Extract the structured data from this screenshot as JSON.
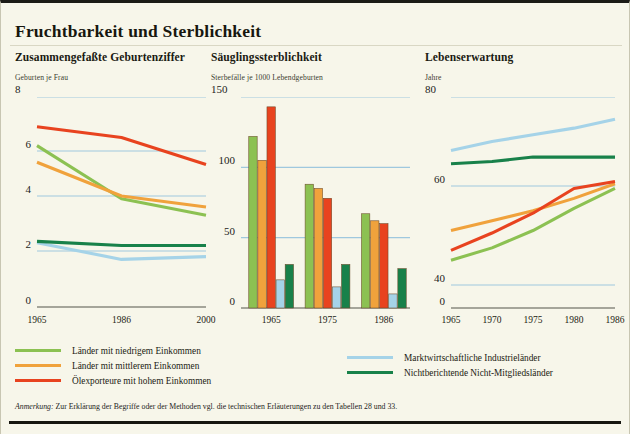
{
  "page": {
    "title": "Fruchtbarkeit und Sterblichkeit",
    "note_label": "Anmerkung:",
    "note_text": " Zur Erklärung der Begriffe oder der Methoden vgl. die technischen Erläuterungen zu den Tabellen 28 und 33.",
    "paper_color": "#f7f6ea",
    "gridline_color": "#9fc8de",
    "axis_color": "#55554a"
  },
  "series_colors": {
    "low_income": "#8cc152",
    "middle_income": "#f0a23c",
    "oil_high_income": "#e8431f",
    "market_industrial": "#a5d3e8",
    "non_reporting": "#18814a"
  },
  "legend": {
    "left": [
      {
        "label": "Länder mit niedrigem Einkommen",
        "color": "#8cc152",
        "key": "low_income"
      },
      {
        "label": "Länder mit mittlerem Einkommen",
        "color": "#f0a23c",
        "key": "middle_income"
      },
      {
        "label": "Ölexporteure mit hohem Einkommen",
        "color": "#e8431f",
        "key": "oil_high_income"
      }
    ],
    "right": [
      {
        "label": "Marktwirtschaftliche Industrieländer",
        "color": "#a5d3e8",
        "key": "market_industrial"
      },
      {
        "label": "Nichtberichtende Nicht-Mitgliedsländer",
        "color": "#18814a",
        "key": "non_reporting"
      }
    ]
  },
  "chart_data": [
    {
      "type": "line",
      "id": "fertility",
      "title": "Zusammengefaßte Geburtenziffer",
      "ylabel": "Geburten je Frau",
      "xlabel": "",
      "x": [
        "1965",
        "1986",
        "2000"
      ],
      "ylim": [
        0,
        8
      ],
      "yticks": [
        0,
        2,
        4,
        6,
        8
      ],
      "ytick_labels": [
        "0",
        "2",
        "4",
        "6",
        "8"
      ],
      "grid": true,
      "axis_max_label": "8",
      "series": [
        {
          "name": "Länder mit niedrigem Einkommen",
          "color": "#8cc152",
          "values": [
            6.2,
            3.9,
            3.3
          ]
        },
        {
          "name": "Länder mit mittlerem Einkommen",
          "color": "#f0a23c",
          "values": [
            5.5,
            4.0,
            3.6
          ]
        },
        {
          "name": "Ölexporteure mit hohem Einkommen",
          "color": "#e8431f",
          "values": [
            6.9,
            6.5,
            5.4
          ]
        },
        {
          "name": "Marktwirtschaftliche Industrieländer",
          "color": "#a5d3e8",
          "values": [
            2.3,
            1.7,
            1.8
          ]
        },
        {
          "name": "Nichtberichtende Nicht-Mitgliedsländer",
          "color": "#18814a",
          "values": [
            2.35,
            2.2,
            2.2
          ]
        }
      ]
    },
    {
      "type": "bar",
      "id": "infant-mortality",
      "title": "Säuglingssterblichkeit",
      "ylabel": "Sterbefälle je 1000 Lebendgeburten",
      "xlabel": "",
      "categories": [
        "1965",
        "1975",
        "1986"
      ],
      "ylim": [
        0,
        150
      ],
      "yticks": [
        0,
        50,
        100,
        150
      ],
      "ytick_labels": [
        "0",
        "50",
        "100",
        "150"
      ],
      "grid": true,
      "axis_max_label": "150",
      "series": [
        {
          "name": "Länder mit niedrigem Einkommen",
          "color": "#8cc152",
          "values": [
            122,
            88,
            67
          ]
        },
        {
          "name": "Länder mit mittlerem Einkommen",
          "color": "#f0a23c",
          "values": [
            105,
            85,
            62
          ]
        },
        {
          "name": "Ölexporteure mit hohem Einkommen",
          "color": "#e8431f",
          "values": [
            143,
            78,
            60
          ]
        },
        {
          "name": "Marktwirtschaftliche Industrieländer",
          "color": "#a5d3e8",
          "values": [
            20,
            15,
            10
          ]
        },
        {
          "name": "Nichtberichtende Nicht-Mitgliedsländer",
          "color": "#18814a",
          "values": [
            31,
            31,
            28
          ]
        }
      ]
    },
    {
      "type": "line",
      "id": "life-expectancy",
      "title": "Lebenserwartung",
      "ylabel": "Jahre",
      "xlabel": "",
      "x": [
        "1965",
        "1970",
        "1975",
        "1980",
        "1986"
      ],
      "ylim": [
        0,
        80
      ],
      "yticks": [
        0,
        40,
        60,
        80
      ],
      "ytick_labels": [
        "0",
        "40",
        "60",
        "80"
      ],
      "grid": true,
      "axis_max_label": "80",
      "series": [
        {
          "name": "Länder mit niedrigem Einkommen",
          "color": "#8cc152",
          "values": [
            45,
            47.5,
            51,
            55.5,
            59.5
          ]
        },
        {
          "name": "Länder mit mittlerem Einkommen",
          "color": "#f0a23c",
          "values": [
            51,
            53,
            55,
            57.5,
            60.5
          ]
        },
        {
          "name": "Ölexporteure mit hohem Einkommen",
          "color": "#e8431f",
          "values": [
            47,
            50.5,
            54.5,
            59.5,
            61
          ]
        },
        {
          "name": "Marktwirtschaftliche Industrieländer",
          "color": "#a5d3e8",
          "values": [
            68,
            70,
            71.5,
            73,
            75
          ]
        },
        {
          "name": "Nichtberichtende Nicht-Mitgliedsländer",
          "color": "#18814a",
          "values": [
            65,
            65.5,
            66.5,
            66.5,
            66.5
          ]
        }
      ]
    }
  ]
}
